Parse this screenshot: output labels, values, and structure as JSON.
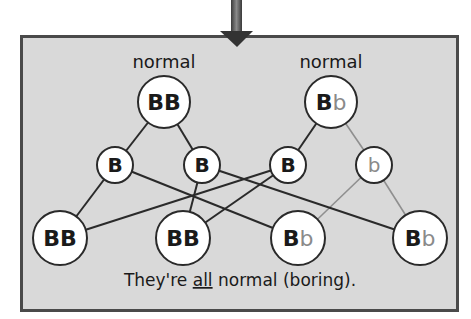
{
  "parents": [
    {
      "id": "P1",
      "title": "normal",
      "genotype": [
        {
          "allele": "B",
          "recessive": false
        },
        {
          "allele": "B",
          "recessive": false
        }
      ]
    },
    {
      "id": "P2",
      "title": "normal",
      "genotype": [
        {
          "allele": "B",
          "recessive": false
        },
        {
          "allele": "b",
          "recessive": true
        }
      ]
    }
  ],
  "gametes": [
    {
      "id": "G1",
      "allele": "B",
      "recessive": false,
      "from": "P1"
    },
    {
      "id": "G2",
      "allele": "B",
      "recessive": false,
      "from": "P1"
    },
    {
      "id": "G3",
      "allele": "B",
      "recessive": false,
      "from": "P2"
    },
    {
      "id": "G4",
      "allele": "b",
      "recessive": true,
      "from": "P2"
    }
  ],
  "offspring": [
    {
      "id": "O1",
      "genotype": [
        {
          "allele": "B",
          "recessive": false
        },
        {
          "allele": "B",
          "recessive": false
        }
      ],
      "from": [
        "G1",
        "G3"
      ]
    },
    {
      "id": "O2",
      "genotype": [
        {
          "allele": "B",
          "recessive": false
        },
        {
          "allele": "B",
          "recessive": false
        }
      ],
      "from": [
        "G2",
        "G3"
      ]
    },
    {
      "id": "O3",
      "genotype": [
        {
          "allele": "B",
          "recessive": false
        },
        {
          "allele": "b",
          "recessive": true
        }
      ],
      "from": [
        "G1",
        "G4"
      ]
    },
    {
      "id": "O4",
      "genotype": [
        {
          "allele": "B",
          "recessive": false
        },
        {
          "allele": "b",
          "recessive": true
        }
      ],
      "from": [
        "G2",
        "G4"
      ]
    }
  ],
  "caption": {
    "before": "They're ",
    "emphasis": "all",
    "after": " normal (boring)."
  },
  "colors": {
    "panel": "#d9d9d9",
    "dominant": "#1a1a1a",
    "recessive": "#8a8a8a",
    "arrow": "#3a3a3a"
  },
  "arrow": {
    "direction": "down"
  }
}
